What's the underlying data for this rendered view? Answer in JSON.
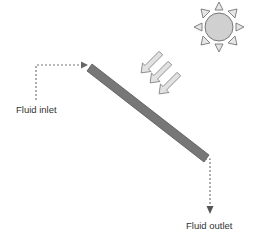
{
  "diagram": {
    "labels": {
      "inlet": "Fluid inlet",
      "outlet": "Fluid outlet"
    },
    "icons": {
      "sun": "sun-icon",
      "rays": "sunlight-arrows-icon"
    },
    "colors": {
      "collector": "#777777",
      "collector_edge": "#555555",
      "sun_fill": "#d0d0d0",
      "sun_stroke": "#777777",
      "ray_fill": "#e0e0e0",
      "ray_stroke": "#8a8a8a",
      "flow_line": "#777777"
    }
  }
}
